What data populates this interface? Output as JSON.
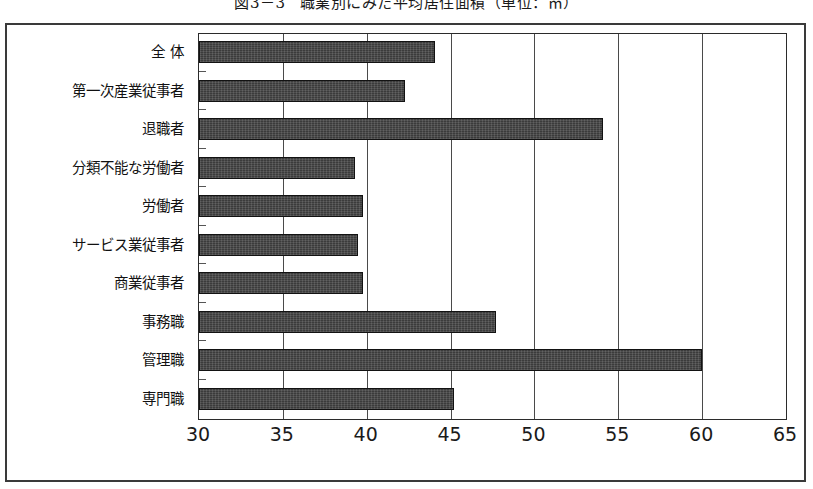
{
  "caption": {
    "number": "図3－3",
    "text": "職業別にみた平均居住面積（単位：㎡）"
  },
  "chart_data": {
    "type": "bar",
    "orientation": "horizontal",
    "xlabel": "",
    "ylabel": "",
    "unit": "㎡",
    "xlim": [
      30,
      65
    ],
    "xticks": [
      "30",
      "35",
      "40",
      "45",
      "50",
      "55",
      "60",
      "65"
    ],
    "xtick_values": [
      30,
      35,
      40,
      45,
      50,
      55,
      60,
      65
    ],
    "grid": true,
    "legend": "none",
    "bar_color": "#3b3b3b",
    "categories": [
      "全 体",
      "第一次産業従事者",
      "退職者",
      "分類不能な労働者",
      "労働者",
      "サービス業従事者",
      "商業従事者",
      "事務職",
      "管理職",
      "専門職"
    ],
    "values": [
      44.1,
      42.3,
      54.1,
      39.3,
      39.8,
      39.5,
      39.8,
      47.7,
      60.0,
      45.2
    ]
  }
}
